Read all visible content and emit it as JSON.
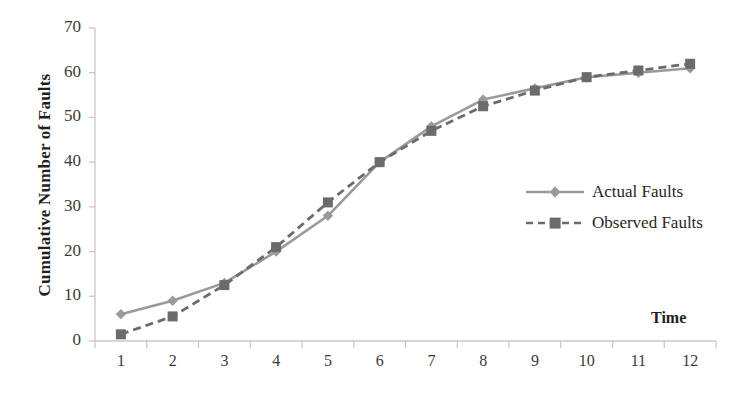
{
  "chart_data": {
    "type": "line",
    "title": "",
    "xlabel": "Time",
    "ylabel": "Cumulative Number of Faults",
    "xlim": [
      0.5,
      12.5
    ],
    "ylim": [
      0,
      70
    ],
    "ytick_values": [
      0,
      10,
      20,
      30,
      40,
      50,
      60,
      70
    ],
    "ytick_labels": [
      "0",
      "10",
      "20",
      "30",
      "40",
      "50",
      "60",
      "70"
    ],
    "xtick_labels": [
      "1",
      "2",
      "3",
      "4",
      "5",
      "6",
      "7",
      "8",
      "9",
      "10",
      "11",
      "12"
    ],
    "x": [
      1,
      2,
      3,
      4,
      5,
      6,
      7,
      8,
      9,
      10,
      11,
      12
    ],
    "grid": false,
    "legend_position": "center right",
    "series": [
      {
        "name": "Actual Faults",
        "values": [
          6,
          9,
          13,
          20,
          28,
          40,
          48,
          54,
          56.5,
          59,
          60,
          61
        ],
        "color": "#9a9a9a",
        "linestyle": "solid",
        "marker": "diamond"
      },
      {
        "name": "Observed Faults",
        "values": [
          1.5,
          5.5,
          12.5,
          21,
          31,
          40,
          47,
          52.5,
          56,
          59,
          60.5,
          62
        ],
        "color": "#6b6b6b",
        "linestyle": "dashed",
        "marker": "square"
      }
    ],
    "axis_color": "#c8c8c8",
    "tick_label_color": "#3a3a3a"
  },
  "legend": {
    "items": [
      {
        "label": "Actual Faults",
        "marker": "diamond-marker-icon"
      },
      {
        "label": "Observed Faults",
        "marker": "square-marker-icon"
      }
    ]
  }
}
